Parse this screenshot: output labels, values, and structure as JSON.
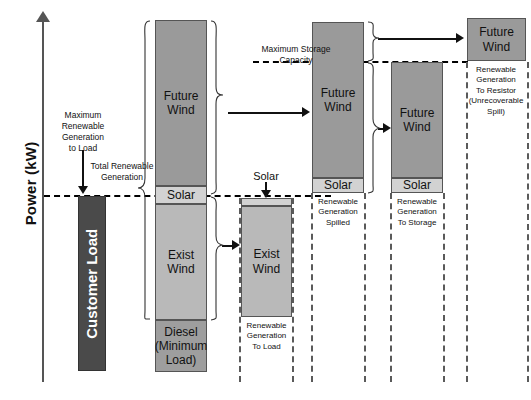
{
  "axis": {
    "y_label": "Power (kW)"
  },
  "annotations": {
    "max_renewable_to_load": "Maximum\nRenewable\nGeneration\nto Load",
    "total_renewable_generation": "Total Renewable\nGeneration",
    "maximum_storage_capacity": "Maximum Storage\nCapacity",
    "solar_callout_a": "Solar",
    "solar_callout_b": "Solar"
  },
  "columns": [
    {
      "id": "customer-load",
      "segments": [
        {
          "name": "customer-load",
          "label": "Customer Load"
        }
      ]
    },
    {
      "id": "total-generation",
      "segments": [
        {
          "name": "future-wind",
          "label": "Future\nWind"
        },
        {
          "name": "solar",
          "label": "Solar"
        },
        {
          "name": "exist-wind",
          "label": "Exist Wind"
        },
        {
          "name": "diesel",
          "label": "Diesel\n(Minimum\nLoad)"
        }
      ]
    },
    {
      "id": "renewable-to-load",
      "segments": [
        {
          "name": "solar",
          "label": ""
        },
        {
          "name": "exist-wind",
          "label": "Exist Wind"
        }
      ],
      "caption": "Renewable\nGeneration\nTo Load"
    },
    {
      "id": "renewable-spilled",
      "segments": [
        {
          "name": "future-wind",
          "label": "Future\nWind"
        },
        {
          "name": "solar",
          "label": "Solar"
        }
      ],
      "caption": "Renewable\nGeneration\nSpilled"
    },
    {
      "id": "renewable-to-storage",
      "segments": [
        {
          "name": "future-wind",
          "label": "Future\nWind"
        },
        {
          "name": "solar",
          "label": "Solar"
        }
      ],
      "caption": "Renewable\nGeneration\nTo Storage"
    },
    {
      "id": "renewable-to-resistor",
      "segments": [
        {
          "name": "future-wind",
          "label": "Future\nWind"
        }
      ],
      "caption": "Renewable\nGeneration\nTo Resistor\n(Unrecoverable\nSpill)"
    }
  ],
  "colors": {
    "future_wind": "#9a9a9a",
    "solar": "#d2d2d2",
    "exist_wind": "#b9b9b9",
    "diesel": "#9e9e9e",
    "customer_load": "#4a4a4a",
    "outline": "#555555",
    "guide": "#000000"
  }
}
